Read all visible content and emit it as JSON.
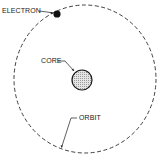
{
  "diagram": {
    "type": "atom-model",
    "labels": {
      "electron": "ELECTRON",
      "core": "CORE",
      "orbit": "ORBIT"
    },
    "colors": {
      "background": "#ffffff",
      "ink": "#1a1a1a",
      "core_fill": "#d8d8d8"
    },
    "orbit": {
      "cx": 85,
      "cy": 79,
      "rx": 71,
      "ry": 74,
      "style": "dashed"
    },
    "core": {
      "cx": 82,
      "cy": 80,
      "r": 10
    },
    "electron": {
      "cx": 57,
      "cy": 14,
      "r": 3.5
    }
  }
}
